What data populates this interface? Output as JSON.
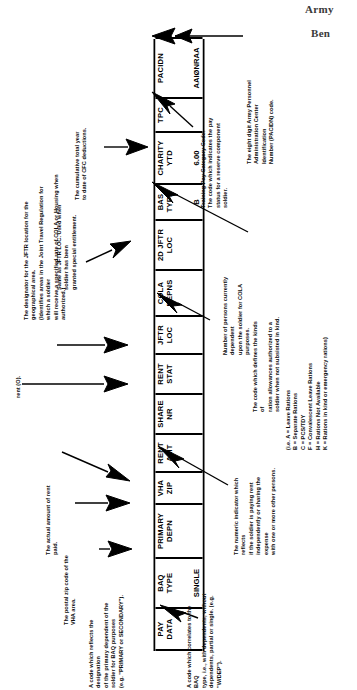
{
  "header": {
    "word1": "Army",
    "word2": "Ben"
  },
  "strip": {
    "name": "pay-data-field-strip",
    "fields": [
      {
        "id": "pay-data",
        "label": "PAY\nDATA",
        "value": ""
      },
      {
        "id": "baq-type",
        "label": "BAQ\nTYPE",
        "value": "SINGLE"
      },
      {
        "id": "primary-depn",
        "label": "PRIMARY\nDEPN",
        "value": ""
      },
      {
        "id": "vha-zip",
        "label": "VHA\nZIP",
        "value": ""
      },
      {
        "id": "rent-amt",
        "label": "RENT\nAMT",
        "value": ""
      },
      {
        "id": "share-nr",
        "label": "SHARE\nNR",
        "value": ""
      },
      {
        "id": "rent-stat",
        "label": "RENT\nSTAT",
        "value": ""
      },
      {
        "id": "jftr-loc",
        "label": "JFTR\nLOC",
        "value": ""
      },
      {
        "id": "cola-depns",
        "label": "COLA\nDEPNS",
        "value": ""
      },
      {
        "id": "2d-jftr-loc",
        "label": "2D JFTR\nLOC",
        "value": ""
      },
      {
        "id": "bas-type",
        "label": "BAS\nTYPE",
        "value": "B"
      },
      {
        "id": "charity-ytd",
        "label": "CHARITY\nYTD",
        "value": "6.00"
      },
      {
        "id": "tpc",
        "label": "TPC",
        "value": ""
      },
      {
        "id": "pacidn",
        "label": "PACIDN",
        "value": "AAIØNRAA"
      }
    ]
  },
  "notes": {
    "baq_type": "A code which correlates to the BAQ\ntype, i.e., with dependents, without\ndependents, partial or single. (e.g. \"W/DEP\").",
    "primary_depn": "A code which reflects the designation\nof the primary dependent of the\nsoldier for BAQ purposes\n(e.g. \"PRIMARY or SECONDARY\").",
    "vha_zip": "The postal zip code of the\nVHA area.",
    "rent_amt": "The actual amount of rent paid.",
    "share_nr": "The numeric indicator which reflects\nif the soldier is paying rent\nindependently or sharing the expense\nwith one or more other persons.",
    "rent_stat": "rent (O).",
    "jftr_loc": "The designator for the JFTR location for the geographical area.\n(Identifies areas in the Joint Travel Regulation for which a soldier\nwill receive a specified rate of COLA or Housing when authorized.)",
    "cola_depns": "Number of persons currently dependent\nupon the soldier for COLA purposes.",
    "second_jftr_loc": "Same as JFTR LOC. Used when soldier has been\ngranted special entitlement.",
    "bas_type": "The code which defines the kinds of\nration allowances authorized to a\nsoldier when not subsisted in kind.",
    "bas_type_codes": "(i.e.  A = Leave Rations\n        B = Separate Rations\n        C = PCS/TDY\n        F = Convalescent Leave Rations\n        H = Rations Not Available\n        K = Rations in kind or emergency rations)",
    "charity_ytd": "The cumulative total year\nto date of CFC deductions.",
    "tpc": "Training Pay Category Code.\nThe code which indicates the pay\nstatus for a reserve component\nsoldier.",
    "pacidn": "The eight digit Army Personnel\nAdministration Center Identification\nNumber (PACIDN) code."
  },
  "colors": {
    "ink": "#000000",
    "paper": "#ffffff",
    "header_text": "#3a3a3a"
  }
}
